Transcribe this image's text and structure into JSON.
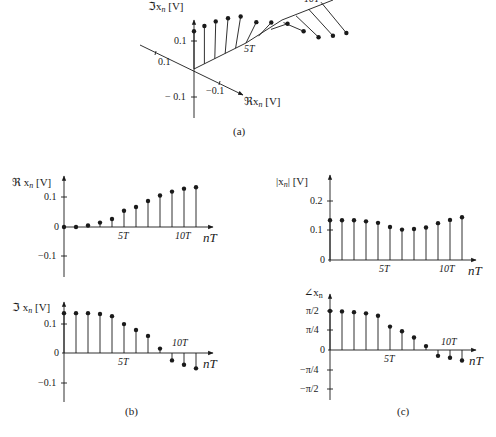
{
  "panels": {
    "a": {
      "caption": "(a)",
      "im_axis_label": "ℑx",
      "im_axis_sub": "n",
      "im_axis_unit": "[V]",
      "re_axis_label": "ℜx",
      "re_axis_sub": "n",
      "re_axis_unit": "[V]",
      "tick_im_pos": "0.1",
      "tick_im_neg": "− 0.1",
      "tick_re_pos": "0.1",
      "tick_re_neg": "−0.1",
      "time_tick_5": "5T",
      "time_tick_10": "10T"
    },
    "b_top": {
      "ylabel": "ℜ x",
      "ylabel_sub": "n",
      "ylabel_unit": "[V]",
      "yticks": [
        "0.1",
        "0",
        "−0.1"
      ],
      "xticks": [
        "5T",
        "10T"
      ],
      "xlabel": "nT"
    },
    "b_bottom": {
      "ylabel": "ℑ x",
      "ylabel_sub": "n",
      "ylabel_unit": "[V]",
      "yticks": [
        "0.1",
        "0",
        "−0.1"
      ],
      "xticks": [
        "5T",
        "10T"
      ],
      "xlabel": "nT",
      "caption": "(b)"
    },
    "c_top": {
      "ylabel": "|x",
      "ylabel_sub": "n",
      "ylabel_unit": "| [V]",
      "yticks": [
        "0.2",
        "0.1",
        "0"
      ],
      "xticks": [
        "5T",
        "10T"
      ],
      "xlabel": "nT"
    },
    "c_bottom": {
      "ylabel": "∠x",
      "ylabel_sub": "n",
      "yticks": [
        "π/2",
        "π/4",
        "0",
        "−π/4",
        "−π/2"
      ],
      "xticks": [
        "5T",
        "10T"
      ],
      "xlabel": "nT",
      "caption": "(c)"
    }
  },
  "chart_data": [
    {
      "type": "line",
      "title": "(a) 3D view of complex sequence x_n versus nT",
      "xlabel": "ℜx_n [V]",
      "ylabel": "ℑx_n [V]",
      "zlabel": "nT",
      "x": [
        0,
        1,
        2,
        3,
        4,
        5,
        6,
        7,
        8,
        9,
        10,
        11
      ],
      "series": [
        {
          "name": "Re x_n",
          "values": [
            0,
            0,
            0.005,
            0.015,
            0.027,
            0.055,
            0.068,
            0.088,
            0.107,
            0.12,
            0.13,
            0.135
          ]
        },
        {
          "name": "Im x_n",
          "values": [
            0.135,
            0.135,
            0.135,
            0.132,
            0.125,
            0.098,
            0.078,
            0.058,
            0.015,
            -0.025,
            -0.04,
            -0.052
          ]
        }
      ]
    },
    {
      "type": "scatter",
      "title": "(b) Real part (stem plot)",
      "xlabel": "nT",
      "ylabel": "ℜ x_n [V]",
      "x": [
        0,
        1,
        2,
        3,
        4,
        5,
        6,
        7,
        8,
        9,
        10,
        11
      ],
      "xtick_labels": {
        "5": "5T",
        "10": "10T"
      },
      "values": [
        0,
        0,
        0.005,
        0.015,
        0.027,
        0.055,
        0.068,
        0.088,
        0.107,
        0.12,
        0.13,
        0.135
      ],
      "ylim": [
        -0.15,
        0.17
      ],
      "yticks": [
        -0.1,
        0,
        0.1
      ]
    },
    {
      "type": "scatter",
      "title": "(b) Imaginary part (stem plot)",
      "xlabel": "nT",
      "ylabel": "ℑ x_n [V]",
      "x": [
        0,
        1,
        2,
        3,
        4,
        5,
        6,
        7,
        8,
        9,
        10,
        11
      ],
      "xtick_labels": {
        "5": "5T",
        "10": "10T"
      },
      "values": [
        0.135,
        0.135,
        0.135,
        0.132,
        0.125,
        0.098,
        0.078,
        0.058,
        0.015,
        -0.025,
        -0.04,
        -0.052
      ],
      "ylim": [
        -0.15,
        0.17
      ],
      "yticks": [
        -0.1,
        0,
        0.1
      ]
    },
    {
      "type": "scatter",
      "title": "(c) Magnitude (stem plot)",
      "xlabel": "nT",
      "ylabel": "|x_n| [V]",
      "x": [
        0,
        1,
        2,
        3,
        4,
        5,
        6,
        7,
        8,
        9,
        10,
        11
      ],
      "xtick_labels": {
        "5": "5T",
        "10": "10T"
      },
      "values": [
        0.135,
        0.135,
        0.135,
        0.131,
        0.126,
        0.112,
        0.103,
        0.105,
        0.11,
        0.125,
        0.136,
        0.145
      ],
      "ylim": [
        0,
        0.27
      ],
      "yticks": [
        0,
        0.1,
        0.2
      ]
    },
    {
      "type": "scatter",
      "title": "(c) Phase (stem plot)",
      "xlabel": "nT",
      "ylabel": "∠x_n",
      "x": [
        0,
        1,
        2,
        3,
        4,
        5,
        6,
        7,
        8,
        9,
        10,
        11
      ],
      "xtick_labels": {
        "5": "5T",
        "10": "10T"
      },
      "values_rad": [
        1.571,
        1.555,
        1.524,
        1.477,
        1.382,
        0.942,
        0.754,
        0.503,
        0.157,
        -0.236,
        -0.314,
        -0.424
      ],
      "ylim": [
        -1.75,
        1.8
      ],
      "yticks": [
        "-π/2",
        "-π/4",
        "0",
        "π/4",
        "π/2"
      ]
    }
  ]
}
